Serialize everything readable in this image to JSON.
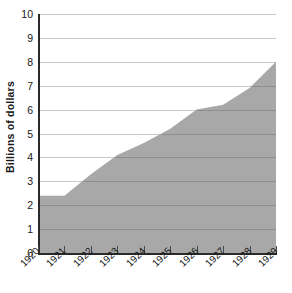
{
  "chart_data": {
    "type": "area",
    "title": "",
    "xlabel": "",
    "ylabel": "Billions of dollars",
    "categories": [
      "1920",
      "1921",
      "1922",
      "1923",
      "1924",
      "1925",
      "1926",
      "1927",
      "1928",
      "1929"
    ],
    "x": [
      1920,
      1921,
      1922,
      1923,
      1924,
      1925,
      1926,
      1927,
      1928,
      1929
    ],
    "values": [
      2.4,
      2.4,
      3.3,
      4.1,
      4.6,
      5.2,
      6.0,
      6.2,
      6.9,
      8.0
    ],
    "xlim": [
      1920,
      1929
    ],
    "ylim": [
      0,
      10
    ],
    "yticks": [
      0,
      1,
      2,
      3,
      4,
      5,
      6,
      7,
      8,
      9,
      10
    ],
    "ytick_labels": [
      "0",
      "1",
      "2",
      "3",
      "4",
      "5",
      "6",
      "7",
      "8",
      "9",
      "10"
    ],
    "grid": true,
    "legend": false,
    "legend_position": "none",
    "series": [
      {
        "name": "Billions of dollars",
        "values": [
          2.4,
          2.4,
          3.3,
          4.1,
          4.6,
          5.2,
          6.0,
          6.2,
          6.9,
          8.0
        ]
      }
    ],
    "colors": {
      "area_fill": "#a8a8a8",
      "gridline_above": "#c9c9c9",
      "gridline_below": "#8e8e8e",
      "axis": "#2a2a2a",
      "text": "#1a1a1a"
    }
  }
}
